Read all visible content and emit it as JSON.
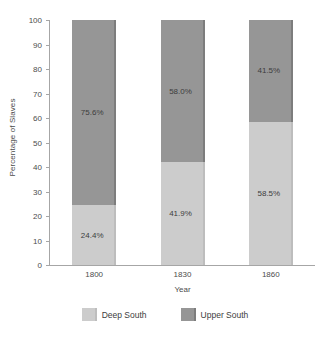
{
  "chart_data": {
    "type": "bar",
    "subtype": "stacked-100-percent",
    "title": "",
    "xlabel": "Year",
    "ylabel": "Percentage of Slaves",
    "categories": [
      "1800",
      "1830",
      "1860"
    ],
    "ylim": [
      0,
      100
    ],
    "yticks": [
      0,
      10,
      20,
      30,
      40,
      50,
      60,
      70,
      80,
      90,
      100
    ],
    "ytick_labels": [
      "0",
      "10",
      "20",
      "30",
      "40",
      "50",
      "60",
      "70",
      "80",
      "90",
      "100"
    ],
    "grid": false,
    "legend_position": "bottom",
    "series": [
      {
        "name": "Deep South",
        "color": "#cccccc",
        "values": [
          24.4,
          41.9,
          58.5
        ],
        "labels": [
          "24.4%",
          "41.9%",
          "58.5%"
        ]
      },
      {
        "name": "Upper South",
        "color": "#969696",
        "values": [
          75.6,
          58.0,
          41.5
        ],
        "labels": [
          "75.6%",
          "58.0%",
          "41.5%"
        ]
      }
    ],
    "legend": [
      {
        "label": "Deep South",
        "color": "#cccccc"
      },
      {
        "label": "Upper South",
        "color": "#969696"
      }
    ]
  }
}
